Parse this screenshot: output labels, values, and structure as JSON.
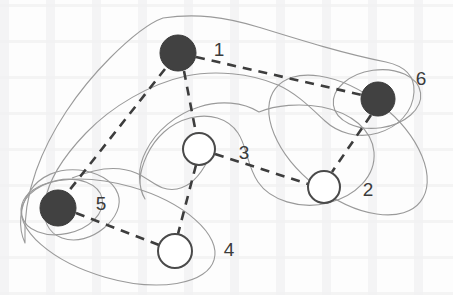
{
  "figure": {
    "background_color": "#fdfdfd",
    "node_fill_dark": "#414141",
    "node_fill_light": "#ffffff",
    "node_stroke": "#4a4a4a",
    "edge_color": "#3d3d3d",
    "hull_color": "#9a9a9a",
    "label_color": "#3b3b3b"
  },
  "nodes": [
    {
      "id": "1",
      "label": "1",
      "cx": 178,
      "cy": 53,
      "r": 18,
      "type": "filled",
      "label_x": 219,
      "label_y": 49
    },
    {
      "id": "2",
      "label": "2",
      "cx": 324,
      "cy": 187,
      "r": 16,
      "type": "open",
      "label_x": 368,
      "label_y": 189
    },
    {
      "id": "3",
      "label": "3",
      "cx": 199,
      "cy": 149,
      "r": 16,
      "type": "open",
      "label_x": 244,
      "label_y": 152
    },
    {
      "id": "4",
      "label": "4",
      "cx": 175,
      "cy": 251,
      "r": 17,
      "type": "open",
      "label_x": 229,
      "label_y": 249
    },
    {
      "id": "5",
      "label": "5",
      "cx": 58,
      "cy": 208,
      "r": 18,
      "type": "filled",
      "label_x": 101,
      "label_y": 203
    },
    {
      "id": "6",
      "label": "6",
      "cx": 378,
      "cy": 99,
      "r": 17,
      "type": "filled",
      "label_x": 421,
      "label_y": 78
    }
  ],
  "edges": [
    {
      "from": "1",
      "to": "6"
    },
    {
      "from": "1",
      "to": "3"
    },
    {
      "from": "1",
      "to": "5"
    },
    {
      "from": "3",
      "to": "2"
    },
    {
      "from": "3",
      "to": "4"
    },
    {
      "from": "5",
      "to": "4"
    },
    {
      "from": "6",
      "to": "2"
    }
  ],
  "hulls": [
    {
      "name": "outer-hull",
      "members": [
        "1",
        "5",
        "6"
      ]
    },
    {
      "name": "hull-node-5",
      "members": [
        "5"
      ]
    },
    {
      "name": "hull-5-4",
      "members": [
        "5",
        "4"
      ]
    },
    {
      "name": "hull-node-6",
      "members": [
        "6"
      ]
    },
    {
      "name": "hull-6-2",
      "members": [
        "6",
        "2"
      ]
    },
    {
      "name": "hull-3-2",
      "members": [
        "3",
        "2"
      ]
    }
  ],
  "legend": {
    "filled_meaning": "filled node",
    "open_meaning": "open node",
    "edge_style": "dashed"
  }
}
